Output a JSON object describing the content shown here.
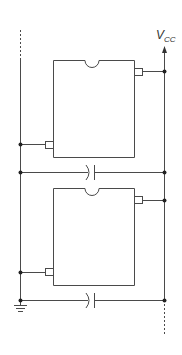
{
  "diagram": {
    "title": "",
    "supply_label": {
      "main": "V",
      "subscript": "CC"
    },
    "colors": {
      "line": "#4a4a4a",
      "node": "#222222",
      "background": "#ffffff"
    },
    "components": [
      {
        "id": "ic-1",
        "type": "integrated-circuit",
        "position": "top",
        "pins": [
          "vcc-pin",
          "gnd-pin"
        ]
      },
      {
        "id": "ic-2",
        "type": "integrated-circuit",
        "position": "bottom",
        "pins": [
          "vcc-pin",
          "gnd-pin"
        ]
      },
      {
        "id": "cap-1",
        "type": "decoupling-capacitor",
        "between": [
          "left-rail",
          "right-rail"
        ],
        "position": "below ic-1"
      },
      {
        "id": "cap-2",
        "type": "decoupling-capacitor",
        "between": [
          "left-rail",
          "right-rail"
        ],
        "position": "below ic-2"
      },
      {
        "id": "ground",
        "type": "ground-symbol",
        "attached_to": "left-rail"
      }
    ],
    "rails": [
      {
        "id": "left-rail",
        "role": "ground",
        "continues": "up (dashed)"
      },
      {
        "id": "right-rail",
        "role": "Vcc",
        "continues": "down (dashed)",
        "arrow": "up"
      }
    ]
  }
}
